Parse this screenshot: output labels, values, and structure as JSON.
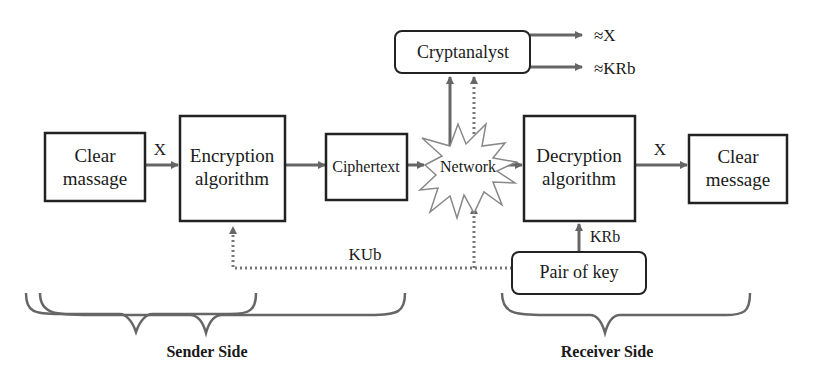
{
  "diagram": {
    "nodes": {
      "clear_input": {
        "line1": "Clear",
        "line2": "massage"
      },
      "encryption": {
        "line1": "Encryption",
        "line2": "algorithm"
      },
      "ciphertext": {
        "label": "Ciphertext"
      },
      "network": {
        "label": "Network"
      },
      "cryptanalyst": {
        "label": "Cryptanalyst"
      },
      "decryption": {
        "line1": "Decryption",
        "line2": "algorithm"
      },
      "clear_output": {
        "line1": "Clear",
        "line2": "message"
      },
      "key_pair": {
        "label": "Pair of key"
      }
    },
    "edge_labels": {
      "x_in": "X",
      "x_out": "X",
      "kub": "KUb",
      "krb": "KRb",
      "approx_x": "≈X",
      "approx_krb": "≈KRb"
    },
    "groups": {
      "sender": "Sender Side",
      "receiver": "Receiver Side"
    }
  }
}
